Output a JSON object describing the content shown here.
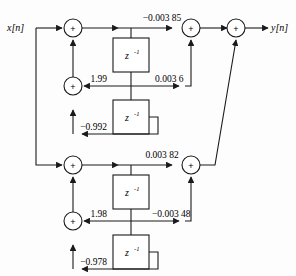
{
  "figure": {
    "type": "signal-flow-diagram",
    "input_label": "x[n]",
    "output_label": "y[n]",
    "adder_symbol": "+",
    "delay_label_base": "z",
    "delay_label_exponent": "-1",
    "line_color": "#1a1a1a",
    "background_color": "#ffffff"
  },
  "sections": [
    {
      "name": "section-1",
      "feedforward_top": "−0.003 85",
      "feedforward_mid": "0.003 6",
      "feedback_first": "1.99",
      "feedback_second": "−0.992",
      "delays": [
        "z",
        "z"
      ]
    },
    {
      "name": "section-2",
      "feedforward_top": "0.003 82",
      "feedforward_mid": "−0.003 48",
      "feedback_first": "1.98",
      "feedback_second": "−0.978",
      "delays": [
        "z",
        "z"
      ]
    }
  ],
  "nodes": {
    "adder_s1_in": "+",
    "adder_s1_fb": "+",
    "adder_s1_fb2": "+",
    "adder_s1_out": "+",
    "adder_s2_in": "+",
    "adder_s2_fb": "+",
    "adder_s2_fb2": "+",
    "adder_s2_out": "+",
    "adder_final": "+"
  }
}
